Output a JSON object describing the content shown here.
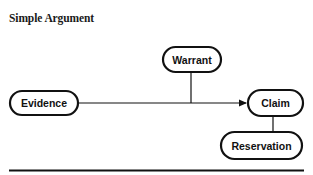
{
  "title": "Simple Argument",
  "diagram": {
    "nodes": [
      {
        "id": "evidence",
        "label": "Evidence"
      },
      {
        "id": "warrant",
        "label": "Warrant"
      },
      {
        "id": "claim",
        "label": "Claim"
      },
      {
        "id": "reservation",
        "label": "Reservation"
      }
    ],
    "edges": [
      {
        "from": "evidence",
        "to": "claim",
        "type": "arrow"
      },
      {
        "from": "warrant",
        "to": "evidence-claim-edge",
        "type": "line"
      },
      {
        "from": "claim",
        "to": "reservation",
        "type": "line"
      }
    ],
    "colors": {
      "stroke": "#111111",
      "fill": "#ffffff"
    }
  }
}
